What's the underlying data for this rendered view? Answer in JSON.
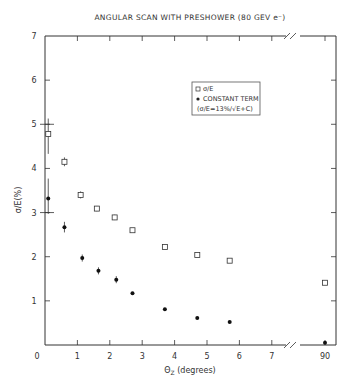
{
  "chart_data": {
    "type": "scatter",
    "title": "ANGULAR SCAN WITH PRESHOWER (80 GEV e⁻)",
    "xlabel": "ΘZ (degrees)",
    "ylabel": "σ/E(%)",
    "xlim": [
      0,
      7.5
    ],
    "x_break": {
      "after": 7,
      "jump_to": 90
    },
    "ylim": [
      0,
      7
    ],
    "x_ticks": [
      "0",
      "1",
      "2",
      "3",
      "4",
      "5",
      "6",
      "7",
      "90"
    ],
    "y_ticks": [
      "0",
      "1",
      "2",
      "3",
      "4",
      "5",
      "6",
      "7"
    ],
    "grid": false,
    "legend_position": "upper-center",
    "legend": [
      {
        "marker": "open-square",
        "label": "σ/E"
      },
      {
        "marker": "filled-circle",
        "label": "CONSTANT TERM"
      },
      {
        "marker": "none",
        "label": "(σ/E=13%/√E+C)"
      }
    ],
    "series": [
      {
        "name": "σ/E",
        "marker": "open-square",
        "x": [
          0.1,
          0.6,
          1.1,
          1.6,
          2.15,
          2.7,
          3.7,
          4.7,
          5.7,
          90
        ],
        "y": [
          4.78,
          4.15,
          3.4,
          3.09,
          2.89,
          2.6,
          2.22,
          2.04,
          1.91,
          1.41
        ],
        "yerr_low": [
          0.45,
          0.1,
          0.08,
          0.06,
          0.06,
          0,
          0,
          0,
          0,
          0
        ],
        "yerr_high": [
          0.35,
          0.1,
          0.08,
          0.06,
          0.06,
          0,
          0,
          0,
          0,
          0
        ]
      },
      {
        "name": "CONSTANT TERM",
        "marker": "filled-circle",
        "x": [
          0.1,
          0.6,
          1.15,
          1.65,
          2.2,
          2.7,
          3.7,
          4.7,
          5.7,
          90
        ],
        "y": [
          3.32,
          2.67,
          1.97,
          1.68,
          1.48,
          1.17,
          0.81,
          0.61,
          0.52,
          0.05
        ],
        "yerr_low": [
          0.35,
          0.12,
          0.08,
          0.08,
          0.08,
          0.05,
          0.05,
          0.05,
          0.05,
          0.05
        ],
        "yerr_high": [
          0.45,
          0.12,
          0.08,
          0.08,
          0.08,
          0.05,
          0.05,
          0.05,
          0.05,
          0.05
        ]
      }
    ]
  }
}
